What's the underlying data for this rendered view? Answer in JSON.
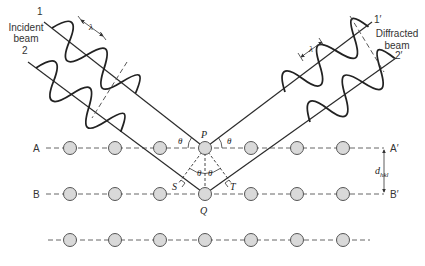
{
  "diagram": {
    "incident": {
      "beam_label_line1": "Incident",
      "beam_label_line2": "beam",
      "ray1_label": "1",
      "ray2_label": "2",
      "wavelength_label": "λ"
    },
    "diffracted": {
      "beam_label_line1": "Diffracted",
      "beam_label_line2": "beam",
      "ray1_label": "1′",
      "ray2_label": "2′",
      "wavelength_label": "λ"
    },
    "planes": {
      "top_left": "A",
      "top_right": "A′",
      "mid_left": "B",
      "mid_right": "B′",
      "spacing_label": "d",
      "spacing_subscript": "hkl"
    },
    "points": {
      "upper_atom": "P",
      "lower_atom": "Q",
      "left_foot": "S",
      "right_foot": "T"
    },
    "angle_label": "θ",
    "colors": {
      "line": "#2b2b2b",
      "atom_fill": "#d9d9d9",
      "atom_stroke": "#555555",
      "dash": "#666666"
    },
    "rows": [
      {
        "y": 148,
        "atoms_x": [
          70,
          115,
          160,
          205,
          251,
          297,
          343
        ]
      },
      {
        "y": 194,
        "atoms_x": [
          70,
          115,
          160,
          205,
          251,
          297,
          343
        ]
      },
      {
        "y": 240,
        "atoms_x": [
          70,
          115,
          160,
          205,
          251,
          297,
          343
        ]
      }
    ]
  }
}
